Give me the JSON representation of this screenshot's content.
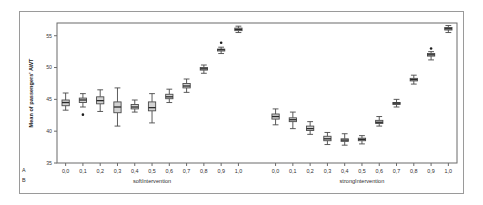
{
  "figure": {
    "background_color": "#ffffff",
    "frame_color": "#9a9a9a",
    "box_fill_color": "#d2d2d2",
    "box_edge_color": "#4a4a4a"
  },
  "axis": {
    "y_label": "Mean of passengers' AWT",
    "y_ticks": [
      "35",
      "40",
      "45",
      "50",
      "55"
    ],
    "row_key_a": "A",
    "row_key_b": "B"
  },
  "chart_data": {
    "type": "box",
    "title": "",
    "xlabel": "",
    "ylabel": "Mean of passengers' AWT",
    "ylim": [
      35,
      57
    ],
    "y_ticks": [
      35,
      40,
      45,
      50,
      55
    ],
    "grid": false,
    "legend": "none",
    "group_label_row": "B",
    "category_label_row": "A",
    "groups": [
      {
        "name": "softIntervention",
        "categories": [
          "0,0",
          "0,1",
          "0,2",
          "0,3",
          "0,4",
          "0,5",
          "0,6",
          "0,7",
          "0,8",
          "0,9",
          "1,0"
        ],
        "boxes": [
          {
            "category": "0,0",
            "whisker_low": 43.3,
            "q1": 44.0,
            "median": 44.5,
            "q3": 44.9,
            "whisker_high": 46.0,
            "outliers": []
          },
          {
            "category": "0,1",
            "whisker_low": 43.8,
            "q1": 44.5,
            "median": 44.9,
            "q3": 45.2,
            "whisker_high": 45.9,
            "outliers": [
              42.6
            ]
          },
          {
            "category": "0,2",
            "whisker_low": 43.1,
            "q1": 44.3,
            "median": 44.8,
            "q3": 45.4,
            "whisker_high": 46.5,
            "outliers": []
          },
          {
            "category": "0,3",
            "whisker_low": 40.8,
            "q1": 42.9,
            "median": 43.8,
            "q3": 44.6,
            "whisker_high": 46.8,
            "outliers": []
          },
          {
            "category": "0,4",
            "whisker_low": 43.0,
            "q1": 43.5,
            "median": 43.8,
            "q3": 44.2,
            "whisker_high": 44.9,
            "outliers": []
          },
          {
            "category": "0,5",
            "whisker_low": 41.3,
            "q1": 43.2,
            "median": 43.7,
            "q3": 44.6,
            "whisker_high": 45.9,
            "outliers": []
          },
          {
            "category": "0,6",
            "whisker_low": 44.5,
            "q1": 45.1,
            "median": 45.4,
            "q3": 45.8,
            "whisker_high": 46.6,
            "outliers": []
          },
          {
            "category": "0,7",
            "whisker_low": 46.1,
            "q1": 46.8,
            "median": 47.1,
            "q3": 47.5,
            "whisker_high": 48.2,
            "outliers": []
          },
          {
            "category": "0,8",
            "whisker_low": 49.1,
            "q1": 49.6,
            "median": 49.8,
            "q3": 50.0,
            "whisker_high": 50.4,
            "outliers": []
          },
          {
            "category": "0,9",
            "whisker_low": 52.2,
            "q1": 52.6,
            "median": 52.8,
            "q3": 52.9,
            "whisker_high": 53.2,
            "outliers": [
              53.9
            ]
          },
          {
            "category": "1,0",
            "whisker_low": 55.5,
            "q1": 55.8,
            "median": 56.0,
            "q3": 56.2,
            "whisker_high": 56.5,
            "outliers": []
          }
        ]
      },
      {
        "name": "strongIntervention",
        "categories": [
          "0,0",
          "0,1",
          "0,2",
          "0,3",
          "0,4",
          "0,5",
          "0,6",
          "0,7",
          "0,8",
          "0,9",
          "1,0"
        ],
        "boxes": [
          {
            "category": "0,0",
            "whisker_low": 41.0,
            "q1": 41.9,
            "median": 42.3,
            "q3": 42.7,
            "whisker_high": 43.5,
            "outliers": []
          },
          {
            "category": "0,1",
            "whisker_low": 40.4,
            "q1": 41.5,
            "median": 41.8,
            "q3": 42.1,
            "whisker_high": 43.0,
            "outliers": []
          },
          {
            "category": "0,2",
            "whisker_low": 39.5,
            "q1": 40.1,
            "median": 40.4,
            "q3": 40.8,
            "whisker_high": 41.5,
            "outliers": []
          },
          {
            "category": "0,3",
            "whisker_low": 37.9,
            "q1": 38.5,
            "median": 38.8,
            "q3": 39.2,
            "whisker_high": 39.8,
            "outliers": []
          },
          {
            "category": "0,4",
            "whisker_low": 37.8,
            "q1": 38.4,
            "median": 38.6,
            "q3": 38.8,
            "whisker_high": 39.6,
            "outliers": []
          },
          {
            "category": "0,5",
            "whisker_low": 38.0,
            "q1": 38.5,
            "median": 38.7,
            "q3": 38.9,
            "whisker_high": 39.3,
            "outliers": []
          },
          {
            "category": "0,6",
            "whisker_low": 40.8,
            "q1": 41.2,
            "median": 41.4,
            "q3": 41.7,
            "whisker_high": 42.3,
            "outliers": []
          },
          {
            "category": "0,7",
            "whisker_low": 43.8,
            "q1": 44.2,
            "median": 44.4,
            "q3": 44.5,
            "whisker_high": 45.0,
            "outliers": []
          },
          {
            "category": "0,8",
            "whisker_low": 47.4,
            "q1": 47.9,
            "median": 48.1,
            "q3": 48.3,
            "whisker_high": 48.8,
            "outliers": []
          },
          {
            "category": "0,9",
            "whisker_low": 51.2,
            "q1": 51.8,
            "median": 52.0,
            "q3": 52.2,
            "whisker_high": 52.5,
            "outliers": [
              53.0
            ]
          },
          {
            "category": "1,0",
            "whisker_low": 55.5,
            "q1": 55.9,
            "median": 56.1,
            "q3": 56.3,
            "whisker_high": 56.6,
            "outliers": []
          }
        ]
      }
    ]
  }
}
